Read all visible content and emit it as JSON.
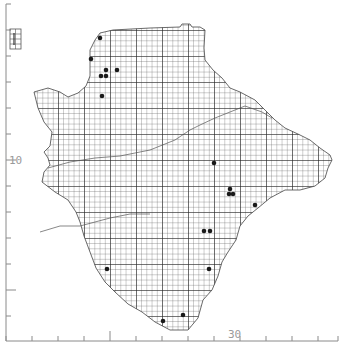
{
  "map": {
    "type": "distribution-grid-map",
    "grid": {
      "cell_px": 5.2,
      "major_every": 5,
      "major_px": 26,
      "origin_x": 6,
      "origin_y": 4,
      "line_color": "#333333",
      "minor_color": "#555555"
    },
    "axes": {
      "left": {
        "x": 6,
        "ticks_y": [
          4,
          30,
          56,
          82,
          108,
          134,
          160,
          186,
          212,
          238,
          264,
          290,
          316
        ],
        "labels": [
          {
            "text": "10",
            "y": 160
          }
        ]
      },
      "bottom": {
        "y": 341,
        "ticks_x": [
          6,
          32,
          58,
          84,
          110,
          136,
          162,
          188,
          214,
          240,
          266,
          292,
          318,
          338
        ],
        "labels": [
          {
            "text": "30",
            "x": 237
          }
        ]
      }
    },
    "legend_box": {
      "x": 10,
      "y": 29,
      "width": 11,
      "height": 20
    },
    "records": [
      {
        "x": 100,
        "y": 38
      },
      {
        "x": 91,
        "y": 59
      },
      {
        "x": 106,
        "y": 70
      },
      {
        "x": 117,
        "y": 70
      },
      {
        "x": 101,
        "y": 76
      },
      {
        "x": 106,
        "y": 76
      },
      {
        "x": 102,
        "y": 96
      },
      {
        "x": 214,
        "y": 163
      },
      {
        "x": 230,
        "y": 189
      },
      {
        "x": 229,
        "y": 194
      },
      {
        "x": 233,
        "y": 194
      },
      {
        "x": 255,
        "y": 205
      },
      {
        "x": 204,
        "y": 231
      },
      {
        "x": 210,
        "y": 231
      },
      {
        "x": 107,
        "y": 269
      },
      {
        "x": 209,
        "y": 269
      },
      {
        "x": 183,
        "y": 315
      },
      {
        "x": 163,
        "y": 321
      }
    ],
    "colors": {
      "dot": "#1a1a1a",
      "outline": "#444444",
      "axis": "#8a8a8a",
      "label": "#9a9a9a"
    }
  }
}
